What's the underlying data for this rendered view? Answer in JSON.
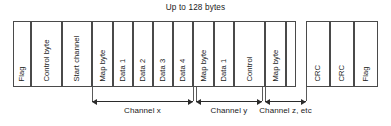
{
  "diagram": {
    "title": "Up to 128 bytes",
    "frame_cells": [
      {
        "label": "Flag",
        "x": 13,
        "w": 18
      },
      {
        "label": "Control byte",
        "x": 31,
        "w": 31
      },
      {
        "label": "Start channel",
        "x": 62,
        "w": 30
      },
      {
        "label": "Map byte",
        "x": 92,
        "w": 21
      },
      {
        "label": "Data 1",
        "x": 113,
        "w": 20
      },
      {
        "label": "Data 2",
        "x": 133,
        "w": 20
      },
      {
        "label": "Data 3",
        "x": 153,
        "w": 20
      },
      {
        "label": "Data 4",
        "x": 173,
        "w": 20
      },
      {
        "label": "Map byte",
        "x": 193,
        "w": 21
      },
      {
        "label": "Data 1",
        "x": 214,
        "w": 20
      },
      {
        "label": "Control",
        "x": 234,
        "w": 31
      },
      {
        "label": "Map byte",
        "x": 265,
        "w": 21
      },
      {
        "label": "",
        "x": 286,
        "w": 10
      },
      {
        "label": "CRC",
        "x": 306,
        "w": 24
      },
      {
        "label": "CRC",
        "x": 330,
        "w": 24
      },
      {
        "label": "Flag",
        "x": 354,
        "w": 24
      }
    ],
    "boundary_ticks": [
      {
        "x": 92,
        "top": 87,
        "h": 14
      },
      {
        "x": 193,
        "top": 87,
        "h": 14
      },
      {
        "x": 196,
        "top": 87,
        "h": 14
      },
      {
        "x": 262,
        "top": 87,
        "h": 14
      },
      {
        "x": 265,
        "top": 87,
        "h": 14
      },
      {
        "x": 306,
        "top": 87,
        "h": 14
      }
    ],
    "dimensions": [
      {
        "label": "Channel x",
        "x": 92,
        "w": 101
      },
      {
        "label": "Channel y",
        "x": 196,
        "w": 66
      },
      {
        "label": "Channel z, etc",
        "x": 265,
        "w": 41
      }
    ]
  },
  "colors": {
    "ink": "#1a1a1a",
    "rule": "#4a4a4a",
    "arrow": "#2b2b2b",
    "background": "#ffffff"
  }
}
